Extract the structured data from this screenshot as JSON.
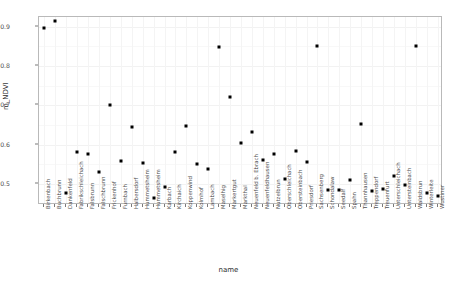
{
  "chart_data": {
    "type": "scatter",
    "title": "",
    "xlabel": "name",
    "ylabel": "m_NDVI",
    "ylim": [
      0.447,
      0.925
    ],
    "yticks": [
      0.5,
      0.6,
      0.7,
      0.8,
      0.9
    ],
    "ytick_labels": [
      "0.5",
      "0.6",
      "0.7",
      "0.8",
      "0.9"
    ],
    "grid": true,
    "legend": "none",
    "point_color": "#000000",
    "panel_border_color": "#b9b9b9",
    "grid_color": "#f2f2f2",
    "categories": [
      "Birkenbach",
      "Buchbrunn",
      "Dankenfeld",
      "Fabrikschleichach",
      "Falsbrunn",
      "Falschbrunn",
      "Frickenhof",
      "Furnbach",
      "Halbersdorf",
      "Hummetsheim",
      "Hummetsheim",
      "Karbach",
      "Kirchaich",
      "Koppenwind",
      "Kolmhof",
      "Lambach",
      "Maselhig",
      "Markertgut",
      "Markthal",
      "Neuenfeld b. Ebrach",
      "Neuenfeldhausen",
      "Nutzelbrun",
      "Oberschleichach",
      "Obersteinbach",
      "Priesdorf",
      "Sachsenberg",
      "Schondalaw",
      "Seedalf",
      "Spahn",
      "Thannhausen",
      "Treppendorf",
      "Treuenfurt",
      "Unterschleichach",
      "Untersteinbach",
      "Waldsbrun",
      "Winterleite",
      "Wustiner"
    ],
    "values": [
      0.897,
      0.915,
      0.477,
      0.583,
      0.577,
      0.531,
      0.7,
      0.558,
      0.645,
      0.553,
      0.466,
      0.493,
      0.583,
      0.648,
      0.55,
      0.539,
      0.848,
      0.722,
      0.604,
      0.633,
      0.562,
      0.577,
      0.512,
      0.585,
      0.556,
      0.851,
      0.485,
      0.484,
      0.511,
      0.654,
      0.483,
      0.487,
      0.52,
      0.497,
      0.85,
      0.477,
      0.471
    ],
    "points": [
      {
        "name": "Birkenbach",
        "value": 0.897
      },
      {
        "name": "Buchbrunn",
        "value": 0.915
      },
      {
        "name": "Dankenfeld",
        "value": 0.477
      },
      {
        "name": "Fabrikschleichach",
        "value": 0.583
      },
      {
        "name": "Falsbrunn",
        "value": 0.577
      },
      {
        "name": "Falschbrunn",
        "value": 0.531
      },
      {
        "name": "Frickenhof",
        "value": 0.7
      },
      {
        "name": "Furnbach",
        "value": 0.558
      },
      {
        "name": "Halbersdorf",
        "value": 0.645
      },
      {
        "name": "Hummetsheim",
        "value": 0.553
      },
      {
        "name": "Hummetsheim",
        "value": 0.466
      },
      {
        "name": "Karbach",
        "value": 0.493
      },
      {
        "name": "Kirchaich",
        "value": 0.583
      },
      {
        "name": "Koppenwind",
        "value": 0.648
      },
      {
        "name": "Kolmhof",
        "value": 0.55
      },
      {
        "name": "Lambach",
        "value": 0.539
      },
      {
        "name": "Maselhig",
        "value": 0.848
      },
      {
        "name": "Markertgut",
        "value": 0.722
      },
      {
        "name": "Markthal",
        "value": 0.604
      },
      {
        "name": "Neuenfeld b. Ebrach",
        "value": 0.633
      },
      {
        "name": "Neuenfeldhausen",
        "value": 0.562
      },
      {
        "name": "Nutzelbrun",
        "value": 0.577
      },
      {
        "name": "Oberschleichach",
        "value": 0.512
      },
      {
        "name": "Obersteinbach",
        "value": 0.585
      },
      {
        "name": "Priesdorf",
        "value": 0.556
      },
      {
        "name": "Sachsenberg",
        "value": 0.851
      },
      {
        "name": "Schondalaw",
        "value": 0.485
      },
      {
        "name": "Seedalf",
        "value": 0.484
      },
      {
        "name": "Spahn",
        "value": 0.511
      },
      {
        "name": "Thannhausen",
        "value": 0.654
      },
      {
        "name": "Treppendorf",
        "value": 0.483
      },
      {
        "name": "Treuenfurt",
        "value": 0.487
      },
      {
        "name": "Unterschleichach",
        "value": 0.52
      },
      {
        "name": "Untersteinbach",
        "value": 0.497
      },
      {
        "name": "Waldsbrun",
        "value": 0.85
      },
      {
        "name": "Winterleite",
        "value": 0.477
      },
      {
        "name": "Wustiner",
        "value": 0.471
      }
    ]
  }
}
